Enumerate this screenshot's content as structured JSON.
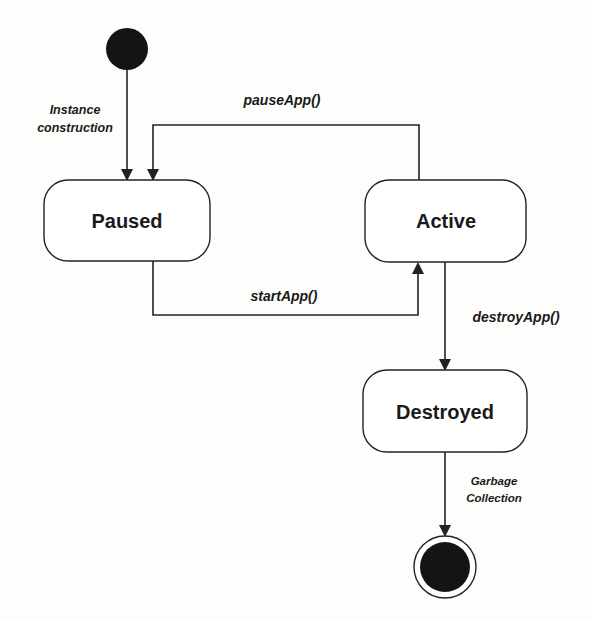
{
  "diagram": {
    "type": "UML state machine",
    "colors": {
      "line": "#222222",
      "fill": "#ffffff",
      "node": "#141414",
      "background": "#fdfdfb"
    },
    "initial_state": {
      "name": "start"
    },
    "final_state": {
      "name": "end"
    },
    "states": [
      {
        "id": "paused",
        "label": "Paused"
      },
      {
        "id": "active",
        "label": "Active"
      },
      {
        "id": "destroyed",
        "label": "Destroyed"
      }
    ],
    "transitions": [
      {
        "from": "start",
        "to": "paused",
        "label_line1": "Instance",
        "label_line2": "construction"
      },
      {
        "from": "active",
        "to": "paused",
        "label": "pauseApp()"
      },
      {
        "from": "paused",
        "to": "active",
        "label": "startApp()"
      },
      {
        "from": "active",
        "to": "destroyed",
        "label": "destroyApp()"
      },
      {
        "from": "destroyed",
        "to": "end",
        "label_line1": "Garbage",
        "label_line2": "Collection"
      }
    ]
  }
}
